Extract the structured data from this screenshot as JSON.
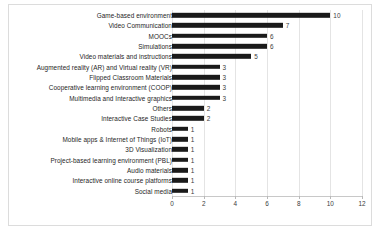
{
  "chart_data": {
    "type": "bar",
    "orientation": "horizontal",
    "title": "",
    "xlabel": "",
    "ylabel": "",
    "xlim": [
      0,
      12
    ],
    "xticks": [
      0,
      2,
      4,
      6,
      8,
      10,
      12
    ],
    "grid": true,
    "legend": false,
    "bar_color": "#1a1a1a",
    "show_value_labels": true,
    "categories": [
      "Game-based environment",
      "Video Communication",
      "MOOCs",
      "Simulations",
      "Video materials and instructions",
      "Augmented reality (AR) and Virtual reality (VR)",
      "Flipped Classroom Materials",
      "Cooperative learning environment (COOP)",
      "Multimedia and Interactive graphics",
      "Others",
      "Interactive Case Studies",
      "Robots",
      "Mobile apps & Internet of Things (IoT)",
      "3D Visualization",
      "Project-based learning environment (PBL)",
      "Audio materials",
      "Interactive online course platforms",
      "Social media"
    ],
    "values": [
      10,
      7,
      6,
      6,
      5,
      3,
      3,
      3,
      3,
      2,
      2,
      1,
      1,
      1,
      1,
      1,
      1,
      1
    ],
    "value_labels": [
      "10",
      "7",
      "6",
      "6",
      "5",
      "3",
      "3",
      "3",
      "3",
      "2",
      "2",
      "1",
      "1",
      "1",
      "1",
      "1",
      "1",
      "1"
    ],
    "tick_labels": [
      "0",
      "2",
      "4",
      "6",
      "8",
      "10",
      "12"
    ]
  }
}
